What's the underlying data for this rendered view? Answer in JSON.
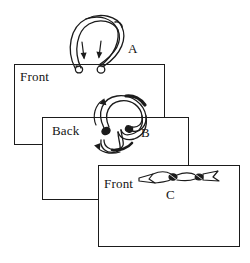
{
  "figure": {
    "background_color": "#ffffff",
    "ink_color": "#1b1b1b",
    "panels": [
      {
        "id": "panel-a",
        "side_label": "Front",
        "step_letter": "A",
        "rect": {
          "x": 14,
          "y": 64,
          "w": 151,
          "h": 81
        },
        "label_pos": {
          "x": 20,
          "y": 70
        },
        "letter_pos": {
          "x": 128,
          "y": 42
        },
        "illustration": "two-loops-with-down-arrows"
      },
      {
        "id": "panel-b",
        "side_label": "Back",
        "step_letter": "B",
        "rect": {
          "x": 42,
          "y": 117,
          "w": 147,
          "h": 83
        },
        "label_pos": {
          "x": 52,
          "y": 124
        },
        "letter_pos": {
          "x": 141,
          "y": 126
        },
        "illustration": "crossed-loop-with-curved-arrows"
      },
      {
        "id": "panel-c",
        "side_label": "Front",
        "step_letter": "C",
        "rect": {
          "x": 98,
          "y": 165,
          "w": 142,
          "h": 82
        },
        "label_pos": {
          "x": 104,
          "y": 177
        },
        "letter_pos": {
          "x": 166,
          "y": 188
        },
        "illustration": "flat-tied-bow-ribbon"
      }
    ]
  }
}
